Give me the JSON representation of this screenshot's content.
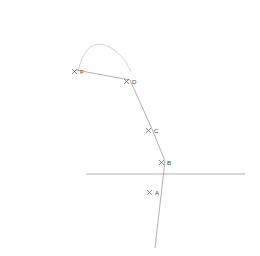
{
  "diagram": {
    "type": "3d-geometry-line-drawing",
    "background_color": "#ffffff",
    "stroke_color": "#9a9a9a",
    "label_color": "#4a4a4a",
    "arc_color": "#c9c9c9",
    "points": [
      {
        "id": "F",
        "label": "F",
        "x": 79,
        "y": 72,
        "marker": "x-marker"
      },
      {
        "id": "D",
        "label": "D",
        "x": 131,
        "y": 82,
        "marker": "x-marker"
      },
      {
        "id": "C",
        "label": "C",
        "x": 153,
        "y": 131,
        "marker": "x-marker"
      },
      {
        "id": "B",
        "label": "B",
        "x": 166,
        "y": 163,
        "marker": "x-marker"
      },
      {
        "id": "A",
        "label": "A",
        "x": 154,
        "y": 193,
        "marker": "x-marker"
      }
    ],
    "planes": [
      {
        "id": "slanted-plane",
        "name": "slanted-back-plane",
        "vertices": "14,11 176,8 245,166 86,166"
      },
      {
        "id": "horizontal-plane",
        "name": "horizontal-base-plane",
        "vertices": "86,166 245,166 229,230 64,230"
      },
      {
        "id": "vertical-plane",
        "name": "vertical-front-plane",
        "vertices": "93,8 73,74 155,248 176,180"
      }
    ],
    "segments": [
      {
        "id": "seg-FD",
        "name": "segment-f-to-d",
        "from": "F",
        "to": "D"
      },
      {
        "id": "seg-DC",
        "name": "segment-d-to-c",
        "from": "D",
        "to": "C"
      },
      {
        "id": "seg-CB",
        "name": "segment-c-to-b",
        "from": "C",
        "to": "B"
      },
      {
        "id": "seg-BA",
        "name": "segment-b-to-a",
        "from": "B",
        "to": "A"
      }
    ],
    "arc": {
      "id": "top-arc",
      "name": "connecting-arc",
      "description": "faint arc from the left edge curving to the right edge near the apex"
    }
  }
}
